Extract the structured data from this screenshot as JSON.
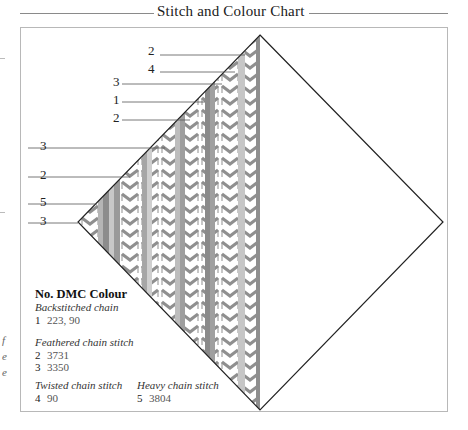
{
  "header": {
    "title": "Stitch and Colour Chart"
  },
  "diagram": {
    "shape": "square rotated 45° (diamond); left half filled with vertical stitch bands",
    "callouts": [
      {
        "label": "2",
        "y": 50
      },
      {
        "label": "4",
        "y": 70
      },
      {
        "label": "3",
        "y": 83
      },
      {
        "label": "1",
        "y": 101
      },
      {
        "label": "2",
        "y": 120
      },
      {
        "label": "3",
        "y": 147
      },
      {
        "label": "2",
        "y": 176
      },
      {
        "label": "5",
        "y": 203
      },
      {
        "label": "3",
        "y": 222
      }
    ],
    "colors": {
      "outline": "#222222",
      "chain_stitch": "#8f8f8f",
      "band_light": "#c9c9c9",
      "band_mid": "#a9a9a9",
      "band_dark": "#8a8a8a"
    }
  },
  "legend": {
    "heading": "No. DMC Colour",
    "groups": [
      {
        "name": "Backstitched chain",
        "items": [
          {
            "no": "1",
            "dmc": "223, 90"
          }
        ]
      },
      {
        "name": "Feathered chain stitch",
        "items": [
          {
            "no": "2",
            "dmc": "3731"
          },
          {
            "no": "3",
            "dmc": "3350"
          }
        ]
      },
      {
        "name": "Twisted chain stitch",
        "items": [
          {
            "no": "4",
            "dmc": "90"
          }
        ]
      },
      {
        "name": "Heavy chain stitch",
        "items": [
          {
            "no": "5",
            "dmc": "3804"
          }
        ]
      }
    ]
  },
  "margin": {
    "fragments": [
      "f",
      "e",
      "e"
    ]
  }
}
